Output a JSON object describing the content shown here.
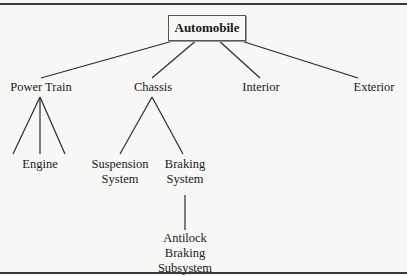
{
  "diagram": {
    "type": "tree",
    "root": {
      "label": "Automobile"
    },
    "nodes": {
      "power_train": "Power Train",
      "chassis": "Chassis",
      "interior": "Interior",
      "exterior": "Exterior",
      "engine": "Engine",
      "suspension_1": "Suspension",
      "suspension_2": "System",
      "braking_1": "Braking",
      "braking_2": "System",
      "abs_1": "Antilock",
      "abs_2": "Braking",
      "abs_3": "Subsystem"
    },
    "edges": [
      [
        "Automobile",
        "Power Train"
      ],
      [
        "Automobile",
        "Chassis"
      ],
      [
        "Automobile",
        "Interior"
      ],
      [
        "Automobile",
        "Exterior"
      ],
      [
        "Power Train",
        "Engine"
      ],
      [
        "Power Train",
        "Engine"
      ],
      [
        "Power Train",
        "Engine"
      ],
      [
        "Chassis",
        "Suspension System"
      ],
      [
        "Chassis",
        "Braking System"
      ],
      [
        "Braking System",
        "Antilock Braking Subsystem"
      ]
    ]
  }
}
